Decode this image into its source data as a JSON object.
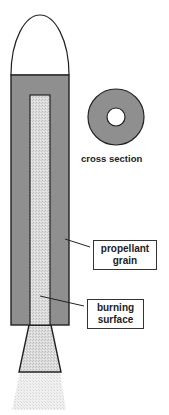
{
  "diagram": {
    "labels": {
      "cross_section": "cross section",
      "propellant_grain": [
        "propellant",
        "grain"
      ],
      "burning_surface": [
        "burning",
        "surface"
      ]
    },
    "colors": {
      "propellant": "#8f8f8f",
      "burning_core": "#d6d6d6",
      "nozzle": "#d9d9d9",
      "exhaust": "#ececec",
      "outline": "#222222",
      "nose": "#ffffff"
    }
  }
}
